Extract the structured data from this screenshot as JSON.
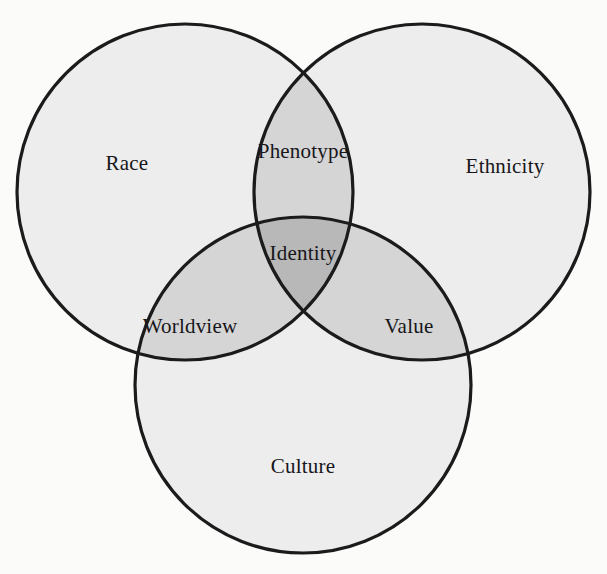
{
  "figure": {
    "type": "venn-diagram-3-set",
    "background_color": "#fbfbfa",
    "stroke_color": "#1b1b1b",
    "fill_single": "#ededed",
    "fill_double": "#d5d5d5",
    "fill_triple": "#b8b8b8"
  },
  "chart_data": {
    "type": "venn",
    "title": "",
    "sets": [
      {
        "id": "race",
        "label": "Race",
        "cx": 185,
        "cy": 192,
        "r": 168
      },
      {
        "id": "ethnicity",
        "label": "Ethnicity",
        "cx": 422,
        "cy": 192,
        "r": 168
      },
      {
        "id": "culture",
        "label": "Culture",
        "cx": 303,
        "cy": 385,
        "r": 168
      }
    ],
    "regions": [
      {
        "id": "race-only",
        "label": "Race",
        "members": [
          "race"
        ],
        "shade": "single"
      },
      {
        "id": "ethnicity-only",
        "label": "Ethnicity",
        "members": [
          "ethnicity"
        ],
        "shade": "single"
      },
      {
        "id": "culture-only",
        "label": "Culture",
        "members": [
          "culture"
        ],
        "shade": "single"
      },
      {
        "id": "race-ethnicity",
        "label": "Phenotype",
        "members": [
          "race",
          "ethnicity"
        ],
        "shade": "double"
      },
      {
        "id": "race-culture",
        "label": "Worldview",
        "members": [
          "race",
          "culture"
        ],
        "shade": "double"
      },
      {
        "id": "ethnicity-culture",
        "label": "Value",
        "members": [
          "ethnicity",
          "culture"
        ],
        "shade": "double"
      },
      {
        "id": "all-three",
        "label": "Identity",
        "members": [
          "race",
          "ethnicity",
          "culture"
        ],
        "shade": "triple"
      }
    ],
    "legend": null,
    "grid": false
  },
  "labels": {
    "race": {
      "text": "Race",
      "x": 127,
      "y": 163
    },
    "ethnicity": {
      "text": "Ethnicity",
      "x": 505,
      "y": 166
    },
    "phenotype": {
      "text": "Phenotype",
      "x": 303,
      "y": 151
    },
    "identity": {
      "text": "Identity",
      "x": 303,
      "y": 253
    },
    "worldview": {
      "text": "Worldview",
      "x": 190,
      "y": 326
    },
    "value": {
      "text": "Value",
      "x": 409,
      "y": 326
    },
    "culture": {
      "text": "Culture",
      "x": 303,
      "y": 466
    }
  }
}
